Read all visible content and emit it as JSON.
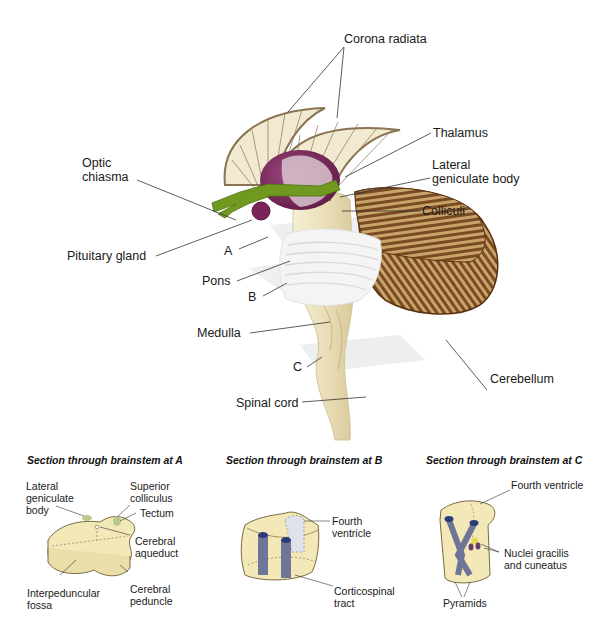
{
  "main_diagram": {
    "labels": {
      "corona_radiata": "Corona radiata",
      "thalamus": "Thalamus",
      "optic_chiasma": "Optic\nchiasma",
      "lateral_geniculate_body": "Lateral\ngeniculate body",
      "colliculi": "Colliculi",
      "pituitary_gland": "Pituitary gland",
      "section_a": "A",
      "pons": "Pons",
      "section_b": "B",
      "medulla": "Medulla",
      "section_c": "C",
      "cerebellum": "Cerebellum",
      "spinal_cord": "Spinal cord"
    },
    "colors": {
      "corona_fill": "#f1ead0",
      "corona_edge": "#8a7350",
      "thalamus": "#7a2458",
      "optic": "#6f9a1f",
      "brainstem": "#eee4c2",
      "pons": "#f4f4f4",
      "cerebellum": "#7a4a22",
      "cerebellum_light": "#c9a46a",
      "plane": "#e6e8ea"
    }
  },
  "sections": [
    {
      "title": "Section through brainstem at A",
      "labels": {
        "lateral_geniculate_body": "Lateral\ngeniculate\nbody",
        "superior_colliculus": "Superior\ncolliculus",
        "tectum": "Tectum",
        "cerebral_aqueduct": "Cerebral\naqueduct",
        "interpeduncular_fossa": "Interpeduncular\nfossa",
        "cerebral_peduncle": "Cerebral\npeduncle"
      }
    },
    {
      "title": "Section through brainstem at B",
      "labels": {
        "fourth_ventricle": "Fourth\nventricle",
        "corticospinal_tract": "Corticospinal\ntract"
      }
    },
    {
      "title": "Section through brainstem at C",
      "labels": {
        "fourth_ventricle": "Fourth ventricle",
        "nuclei_gracilis_cuneatus": "Nuclei gracilis\nand cuneatus",
        "pyramids": "Pyramids"
      }
    }
  ],
  "section_colors": {
    "tissue": "#f3e9b8",
    "tissue_edge": "#7a6a40",
    "tract": "#6f7596",
    "tract_top": "#2b3a7a",
    "ventricle": "#dfe2ea",
    "nucleus_yellow": "#e8d84a",
    "nucleus_purple": "#6a3a6e",
    "tectum_green": "#b8c98a"
  }
}
